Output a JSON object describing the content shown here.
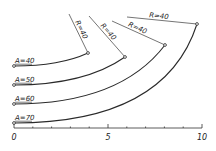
{
  "diagram": {
    "type": "transition-curves",
    "curves": [
      {
        "label": "A=40",
        "radius_label": "R=40",
        "start": [
          14,
          66
        ],
        "end": [
          88,
          53
        ],
        "ctrl": [
          60,
          66
        ],
        "r_start": [
          69,
          14
        ]
      },
      {
        "label": "A=50",
        "radius_label": "R=40",
        "start": [
          14,
          85
        ],
        "end": [
          125,
          57
        ],
        "ctrl": [
          85,
          85
        ],
        "r_start": [
          89,
          16
        ]
      },
      {
        "label": "A=60",
        "radius_label": "R=40",
        "start": [
          14,
          104
        ],
        "end": [
          165,
          45
        ],
        "ctrl": [
          120,
          104
        ],
        "r_start": [
          112,
          21
        ]
      },
      {
        "label": "A=70",
        "radius_label": "R=40",
        "start": [
          14,
          123
        ],
        "end": [
          197,
          24
        ],
        "ctrl": [
          165,
          123
        ],
        "r_start": [
          127,
          17
        ]
      }
    ],
    "axis": {
      "min": 0,
      "max": 10,
      "tick_step": 1,
      "labels": [
        "0",
        "5",
        "10"
      ],
      "x0": 14,
      "x1": 202,
      "y": 128
    }
  }
}
